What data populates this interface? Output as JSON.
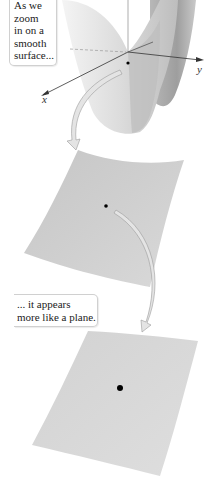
{
  "figure": {
    "callout_top": {
      "lines": [
        "As we",
        "zoom",
        "in on a",
        "smooth",
        "surface..."
      ]
    },
    "callout_middle": {
      "lines": [
        "... it appears",
        "more like a plane."
      ]
    },
    "axes": {
      "x_label": "x",
      "y_label": "y"
    },
    "panels": [
      {
        "name": "saddle-surface",
        "description": "curved saddle surface with axes and marked point"
      },
      {
        "name": "zoomed-patch",
        "description": "zoomed surface patch, slightly curved"
      },
      {
        "name": "plane-patch",
        "description": "further zoomed patch, nearly planar"
      }
    ],
    "colors": {
      "surface_light": "#e6e6e6",
      "surface_mid": "#c8c8c8",
      "surface_dark": "#a9a9a9",
      "arrow_fill": "#e4e4e4",
      "arrow_stroke": "#9a9a9a",
      "point": "#000000"
    }
  }
}
